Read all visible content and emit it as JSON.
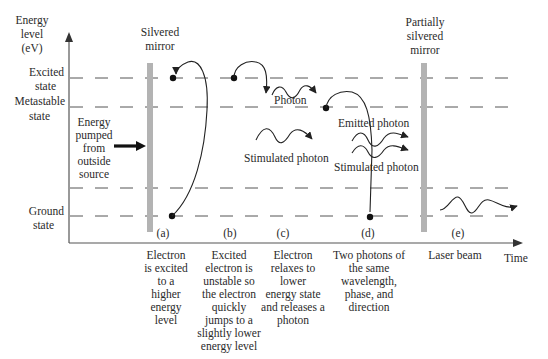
{
  "diagram": {
    "y_axis": {
      "label_lines": [
        "Energy",
        "level",
        "(eV)"
      ]
    },
    "x_axis": {
      "label": "Time"
    },
    "levels": [
      {
        "name": "excited",
        "label_lines": [
          "Excited",
          "state"
        ]
      },
      {
        "name": "metastable",
        "label_lines": [
          "Metastable",
          "state"
        ]
      },
      {
        "name": "ground",
        "label_lines": [
          "Ground",
          "state"
        ]
      }
    ],
    "pump": {
      "label_lines": [
        "Energy",
        "pumped",
        "from",
        "outside",
        "source"
      ]
    },
    "mirrors": {
      "left": {
        "label_lines": [
          "Silvered",
          "mirror"
        ]
      },
      "right": {
        "label_lines": [
          "Partially",
          "silvered",
          "mirror"
        ]
      }
    },
    "photon_labels": {
      "photon": "Photon",
      "stimulated_c": "Stimulated photon",
      "emitted": "Emitted photon",
      "stimulated_d": "Stimulated photon"
    },
    "stages": [
      {
        "tag": "(a)",
        "desc_lines": [
          "Electron",
          "is excited",
          "to a",
          "higher",
          "energy",
          "level"
        ]
      },
      {
        "tag": "(b)",
        "desc_lines": [
          "Excited",
          "electron is",
          "unstable so",
          "the electron",
          "quickly",
          "jumps to a",
          "slightly lower",
          "energy level"
        ]
      },
      {
        "tag": "(c)",
        "desc_lines": [
          "Electron",
          "relaxes to",
          "lower",
          "energy state",
          "and releases a",
          "photon"
        ]
      },
      {
        "tag": "(d)",
        "desc_lines": [
          "Two photons of",
          "the same",
          "wavelength,",
          "phase, and",
          "direction"
        ]
      },
      {
        "tag": "(e)",
        "desc_lines": [
          "Laser beam"
        ]
      }
    ],
    "colors": {
      "mirror": "#b3b3b3",
      "line": "#555555",
      "text": "#2a2a2a"
    }
  }
}
